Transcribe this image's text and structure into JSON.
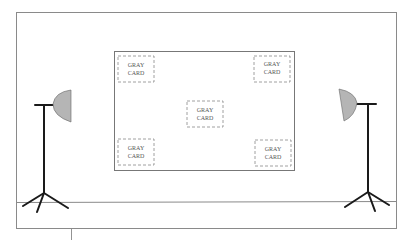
{
  "diagram": {
    "colors": {
      "frame": "#8a8a8a",
      "board": "#777777",
      "card_border": "#888888",
      "stand": "#1a1a1a",
      "light_head": "#b5b5b5"
    },
    "cards": [
      {
        "id": "top-left",
        "line1": "GRAY",
        "line2": "CARD"
      },
      {
        "id": "top-right",
        "line1": "GRAY",
        "line2": "CARD"
      },
      {
        "id": "center",
        "line1": "GRAY",
        "line2": "CARD"
      },
      {
        "id": "bottom-left",
        "line1": "GRAY",
        "line2": "CARD"
      },
      {
        "id": "bottom-right",
        "line1": "GRAY",
        "line2": "CARD"
      }
    ],
    "lights": [
      {
        "id": "left-light",
        "side": "left"
      },
      {
        "id": "right-light",
        "side": "right"
      }
    ]
  }
}
